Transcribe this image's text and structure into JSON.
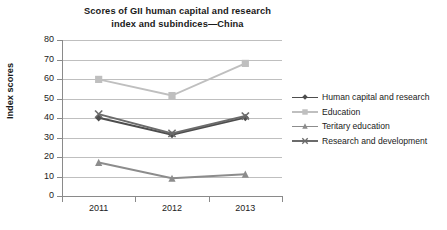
{
  "chart_data": {
    "type": "line",
    "title": "Scores of GII human capital and research index and subindices—China",
    "title_line1": "Scores of GII human capital and research",
    "title_line2": "index and subindices—China",
    "xlabel": "",
    "ylabel": "Index scores",
    "categories": [
      "2011",
      "2012",
      "2013"
    ],
    "ylim": [
      0,
      80
    ],
    "ytick_step": 10,
    "yticks": [
      "80",
      "70",
      "60",
      "50",
      "40",
      "30",
      "20",
      "10",
      "0"
    ],
    "grid": "horizontal",
    "legend_position": "right",
    "series": [
      {
        "name": "Human capital and research",
        "values": [
          40.1,
          31.4,
          40.2
        ],
        "color": "#4d4d4d",
        "marker": "diamond"
      },
      {
        "name": "Education",
        "values": [
          59.8,
          51.5,
          68.0
        ],
        "color": "#bfbfbf",
        "marker": "square"
      },
      {
        "name": "Teritary education",
        "values": [
          17.2,
          9.1,
          11.2
        ],
        "color": "#8c8c8c",
        "marker": "triangle"
      },
      {
        "name": "Research and development",
        "values": [
          42.0,
          32.1,
          41.0
        ],
        "color": "#6b6b6b",
        "marker": "x"
      }
    ]
  },
  "colors": {
    "axis": "#8a8a8a",
    "grid": "#bfbfbf",
    "text": "#1a1a1a",
    "background": "#ffffff"
  }
}
